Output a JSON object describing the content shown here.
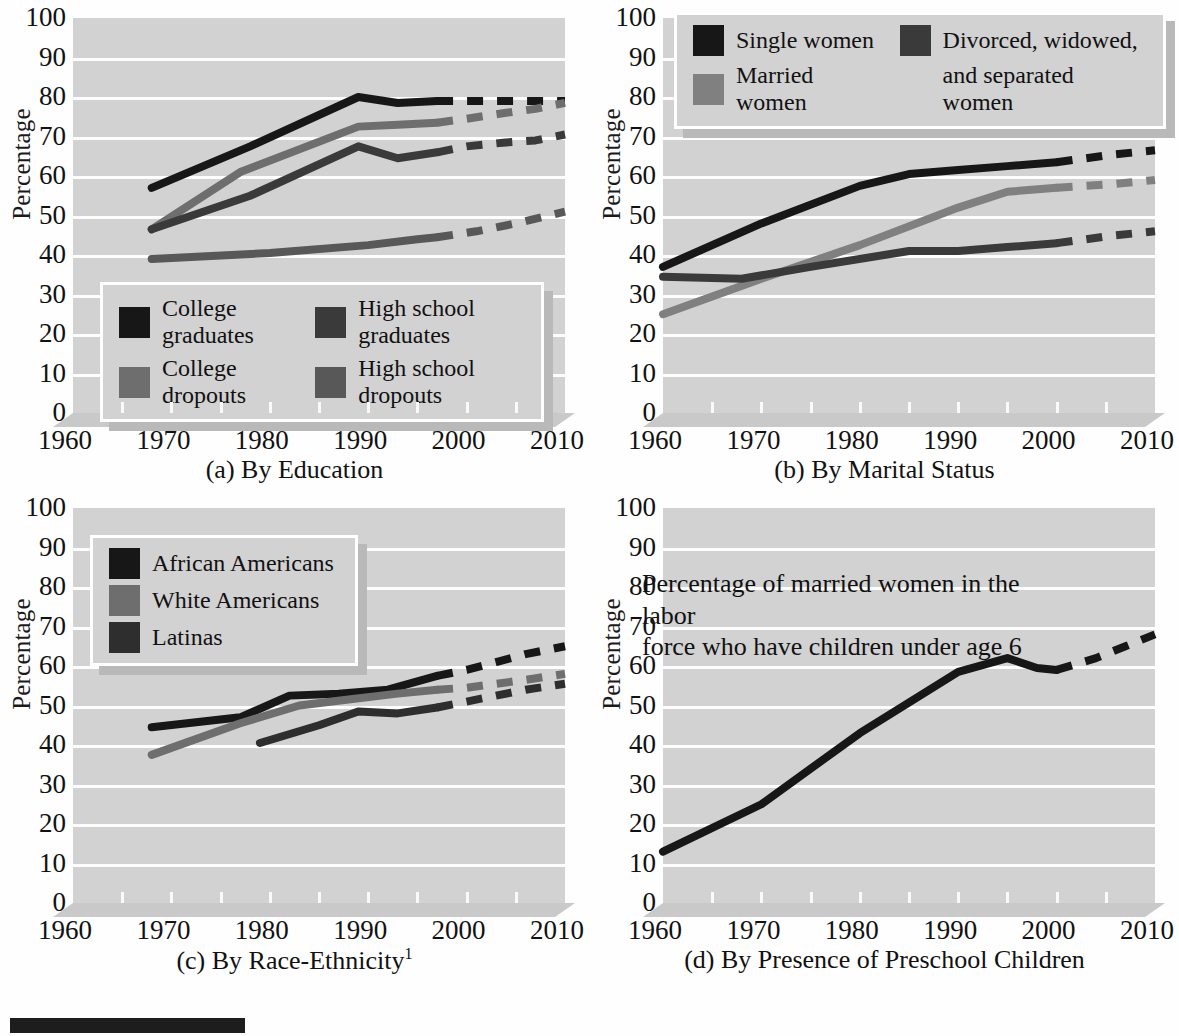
{
  "figure": {
    "axis_label_y": "Percentage",
    "y_ticks": [
      "100",
      "90",
      "80",
      "70",
      "60",
      "50",
      "40",
      "30",
      "20",
      "10",
      "0"
    ],
    "x_ticks": [
      "1960",
      "1970",
      "1980",
      "1990",
      "2000",
      "2010"
    ],
    "colors": {
      "plot_background": "#d2d2d2",
      "gridline": "#fdfdfd",
      "black": "#171717",
      "dark_gray": "#3a3a3a",
      "mid_gray": "#6e6e6e",
      "gray": "#808080",
      "floor": "#c9c9c9"
    }
  },
  "panels": [
    {
      "id": "a",
      "caption": "(a) By Education",
      "caption_sup": "",
      "legend": {
        "items": [
          {
            "label": "College graduates",
            "color": "#171717"
          },
          {
            "label": "High school graduates",
            "color": "#3a3a3a"
          },
          {
            "label": "College dropouts",
            "color": "#6e6e6e"
          },
          {
            "label": "High school dropouts",
            "color": "#585858"
          }
        ]
      }
    },
    {
      "id": "b",
      "caption": "(b) By Marital Status",
      "caption_sup": "",
      "legend": {
        "items": [
          {
            "label": "Single women",
            "color": "#171717"
          },
          {
            "label": "Divorced, widowed,",
            "color": "#3a3a3a"
          },
          {
            "label": "Married women",
            "color": "#808080"
          },
          {
            "label": "and separated women",
            "color": ""
          }
        ]
      }
    },
    {
      "id": "c",
      "caption": "(c) By Race-Ethnicity",
      "caption_sup": "1",
      "legend": {
        "items": [
          {
            "label": "African Americans",
            "color": "#171717"
          },
          {
            "label": "White Americans",
            "color": "#6e6e6e"
          },
          {
            "label": "Latinas",
            "color": "#2e2e2e"
          }
        ]
      }
    },
    {
      "id": "d",
      "caption": "(d) By Presence of Preschool Children",
      "caption_sup": "",
      "plot_title_line1": "Percentage of married women in the labor",
      "plot_title_line2": "force who have children under age 6"
    }
  ],
  "chart_data": [
    {
      "type": "line",
      "id": "a",
      "title": "(a) By Education",
      "xlabel": "",
      "ylabel": "Percentage",
      "xlim": [
        1960,
        2010
      ],
      "ylim": [
        0,
        100
      ],
      "grid": true,
      "legend_position": "inside-bottom-left",
      "series": [
        {
          "name": "College graduates",
          "color": "#171717",
          "solid": {
            "x": [
              1968,
              1978,
              1989,
              1993,
              1997
            ],
            "y": [
              57,
              67.5,
              80,
              78.5,
              79
            ]
          },
          "dashed": {
            "x": [
              1997,
              2000,
              2004,
              2007,
              2010
            ],
            "y": [
              79,
              79,
              79,
              79,
              79
            ]
          }
        },
        {
          "name": "College dropouts",
          "color": "#6e6e6e",
          "solid": {
            "x": [
              1968,
              1977,
              1989,
              1993,
              1997
            ],
            "y": [
              46.5,
              61,
              72.5,
              73,
              73.5
            ]
          },
          "dashed": {
            "x": [
              1997,
              2000,
              2004,
              2007,
              2010
            ],
            "y": [
              73.5,
              74.5,
              76,
              77,
              78.5
            ]
          }
        },
        {
          "name": "High school graduates",
          "color": "#3a3a3a",
          "solid": {
            "x": [
              1968,
              1978,
              1989,
              1993,
              1997
            ],
            "y": [
              46.5,
              55,
              67.5,
              64.5,
              66
            ]
          },
          "dashed": {
            "x": [
              1997,
              2000,
              2004,
              2007,
              2010
            ],
            "y": [
              66,
              67.5,
              68.5,
              69,
              70.5
            ]
          }
        },
        {
          "name": "High school dropouts",
          "color": "#585858",
          "solid": {
            "x": [
              1968,
              1980,
              1990,
              1995,
              1997
            ],
            "y": [
              39,
              40.5,
              42.5,
              44,
              44.5
            ]
          },
          "dashed": {
            "x": [
              1997,
              2001,
              2005,
              2010
            ],
            "y": [
              44.5,
              46,
              48,
              51
            ]
          }
        }
      ]
    },
    {
      "type": "line",
      "id": "b",
      "title": "(b) By Marital Status",
      "xlabel": "",
      "ylabel": "Percentage",
      "xlim": [
        1960,
        2010
      ],
      "ylim": [
        0,
        100
      ],
      "grid": true,
      "legend_position": "inside-top",
      "series": [
        {
          "name": "Single women",
          "color": "#171717",
          "solid": {
            "x": [
              1960,
              1970,
              1980,
              1985,
              1990,
              1995,
              2000
            ],
            "y": [
              37,
              48,
              57.5,
              60.5,
              61.5,
              62.5,
              63.5
            ]
          },
          "dashed": {
            "x": [
              2000,
              2003,
              2006,
              2010
            ],
            "y": [
              63.5,
              64.5,
              65.5,
              66.5
            ]
          }
        },
        {
          "name": "Married women",
          "color": "#808080",
          "solid": {
            "x": [
              1960,
              1970,
              1980,
              1990,
              1995,
              2000
            ],
            "y": [
              25,
              34,
              42.5,
              52,
              56,
              57
            ]
          },
          "dashed": {
            "x": [
              2000,
              2003,
              2006,
              2010
            ],
            "y": [
              57,
              57.5,
              58,
              59
            ]
          }
        },
        {
          "name": "Divorced, widowed, and separated women",
          "color": "#3a3a3a",
          "solid": {
            "x": [
              1960,
              1968,
              1975,
              1985,
              1990,
              1995,
              2000
            ],
            "y": [
              34.5,
              34,
              37,
              41,
              41,
              42,
              43
            ]
          },
          "dashed": {
            "x": [
              2000,
              2003,
              2006,
              2010
            ],
            "y": [
              43,
              44,
              45,
              46
            ]
          }
        }
      ]
    },
    {
      "type": "line",
      "id": "c",
      "title": "(c) By Race-Ethnicity",
      "xlabel": "",
      "ylabel": "Percentage",
      "xlim": [
        1960,
        2010
      ],
      "ylim": [
        0,
        100
      ],
      "grid": true,
      "legend_position": "inside-top-left",
      "series": [
        {
          "name": "African Americans",
          "color": "#171717",
          "solid": {
            "x": [
              1968,
              1977,
              1982,
              1987,
              1992,
              1997
            ],
            "y": [
              44.5,
              47,
              52.5,
              53,
              54,
              57.5
            ]
          },
          "dashed": {
            "x": [
              1997,
              2000,
              2003,
              2006,
              2010
            ],
            "y": [
              57.5,
              59,
              61,
              63,
              65
            ]
          }
        },
        {
          "name": "White Americans",
          "color": "#6e6e6e",
          "solid": {
            "x": [
              1968,
              1977,
              1983,
              1988,
              1993,
              1997
            ],
            "y": [
              37.5,
              45.5,
              50,
              51.5,
              53,
              54
            ]
          },
          "dashed": {
            "x": [
              1997,
              2000,
              2003,
              2006,
              2010
            ],
            "y": [
              54,
              54.5,
              55.5,
              56.5,
              58
            ]
          }
        },
        {
          "name": "Latinas",
          "color": "#2e2e2e",
          "solid": {
            "x": [
              1979,
              1985,
              1989,
              1993,
              1997
            ],
            "y": [
              40.5,
              45,
              48.5,
              48,
              49.5
            ]
          },
          "dashed": {
            "x": [
              1997,
              2000,
              2003,
              2006,
              2010
            ],
            "y": [
              49.5,
              51,
              52.5,
              54,
              55.5
            ]
          }
        }
      ]
    },
    {
      "type": "line",
      "id": "d",
      "title": "(d) By Presence of Preschool Children",
      "annotation": "Percentage of married women in the labor force who have children under age 6",
      "xlabel": "",
      "ylabel": "Percentage",
      "xlim": [
        1960,
        2010
      ],
      "ylim": [
        0,
        100
      ],
      "grid": true,
      "legend_position": "none",
      "series": [
        {
          "name": "Married women with children under 6",
          "color": "#171717",
          "solid": {
            "x": [
              1960,
              1970,
              1980,
              1990,
              1995,
              1998,
              2000
            ],
            "y": [
              13,
              25,
              43,
              58.5,
              62,
              59.5,
              59
            ]
          },
          "dashed": {
            "x": [
              2000,
              2004,
              2007,
              2010
            ],
            "y": [
              59,
              62,
              65,
              68
            ]
          }
        }
      ]
    }
  ]
}
